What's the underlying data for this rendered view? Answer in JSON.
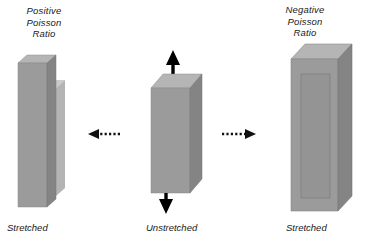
{
  "figure": {
    "type": "diagram",
    "background_color": "#ffffff",
    "panels": [
      {
        "id": "left",
        "title": "Positive\nPoisson\nRatio",
        "bottom_label": "Stretched",
        "description": "Narrow tall block in front of wider faded original block",
        "block_face_color": "#9a9a9a",
        "block_top_color": "#b5b5b5",
        "block_side_color": "#848484",
        "ghost_color": "#c2c2c2"
      },
      {
        "id": "center",
        "title": "",
        "bottom_label": "Unstretched",
        "description": "Original block with vertical stretching arrows",
        "block_face_color": "#9a9a9a",
        "block_top_color": "#b5b5b5",
        "block_side_color": "#848484",
        "arrow_color": "#000000"
      },
      {
        "id": "right",
        "title": "Negative\nPoisson\nRatio",
        "bottom_label": "Stretched",
        "description": "Wider block with inner outline showing expansion",
        "block_face_color": "#9a9a9a",
        "block_top_color": "#b5b5b5",
        "block_side_color": "#848484",
        "ghost_color": "#8d8d8d"
      }
    ],
    "arrows": {
      "left_transition": {
        "direction": "left",
        "style": "dashed-tail-solid-head",
        "color": "#111111"
      },
      "right_transition": {
        "direction": "right",
        "style": "dashed-tail-solid-head",
        "color": "#111111"
      },
      "stretch_up": {
        "direction": "up",
        "style": "solid",
        "color": "#000000"
      },
      "stretch_down": {
        "direction": "down",
        "style": "solid",
        "color": "#000000"
      }
    }
  }
}
